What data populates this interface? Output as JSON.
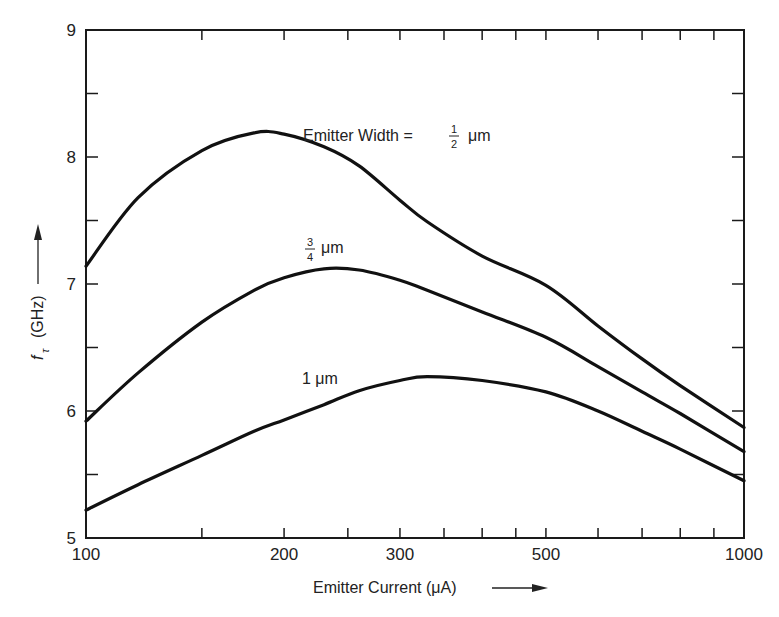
{
  "chart_data": {
    "type": "line",
    "title": "",
    "xlabel": "Emitter Current (μA)",
    "ylabel": "fτ (GHz)",
    "xscale": "log",
    "xlim": [
      100,
      1000
    ],
    "ylim": [
      5,
      9
    ],
    "x_tick_labels": [
      "100",
      "200",
      "300",
      "500",
      "1000"
    ],
    "x_ticks": [
      100,
      150,
      200,
      250,
      300,
      350,
      400,
      450,
      500,
      600,
      700,
      800,
      900,
      1000
    ],
    "y_tick_labels": [
      "5",
      "6",
      "7",
      "8",
      "9"
    ],
    "y_ticks": [
      5,
      5.5,
      6,
      6.5,
      7,
      7.5,
      8,
      8.5,
      9
    ],
    "grid": false,
    "legend": "inline annotations",
    "x": [
      100,
      120,
      150,
      180,
      200,
      230,
      260,
      300,
      330,
      400,
      500,
      600,
      700,
      800,
      1000
    ],
    "series": [
      {
        "name": "Emitter Width = 1/2 μm",
        "values": [
          7.14,
          7.68,
          8.05,
          8.19,
          8.18,
          8.08,
          7.93,
          7.66,
          7.49,
          7.22,
          6.99,
          6.67,
          6.41,
          6.2,
          5.87
        ]
      },
      {
        "name": "3/4 μm",
        "values": [
          5.92,
          6.3,
          6.7,
          6.95,
          7.05,
          7.12,
          7.11,
          7.03,
          6.95,
          6.78,
          6.58,
          6.35,
          6.15,
          5.98,
          5.68
        ]
      },
      {
        "name": "1 μm",
        "values": [
          5.22,
          5.42,
          5.65,
          5.84,
          5.93,
          6.05,
          6.16,
          6.24,
          6.27,
          6.24,
          6.15,
          6.0,
          5.84,
          5.7,
          5.45
        ]
      }
    ],
    "annotations": [
      {
        "text": "Emitter Width = 1/2 μm",
        "near_series": 0
      },
      {
        "text": "3/4 μm",
        "near_series": 1
      },
      {
        "text": "1 μm",
        "near_series": 2
      }
    ]
  },
  "labels": {
    "xlabel": "Emitter Current (μA)",
    "ylabel_f": "f",
    "ylabel_sub": "τ",
    "ylabel_unit": "(GHz)",
    "annot_top_prefix": "Emitter Width = ",
    "annot_top_num": "1",
    "annot_top_den": "2",
    "annot_mid_num": "3",
    "annot_mid_den": "4",
    "annot_unit": "μm",
    "annot_bottom": "1 μm"
  },
  "colors": {
    "line": "#111111",
    "axis": "#1a1a1a",
    "background": "#ffffff"
  }
}
